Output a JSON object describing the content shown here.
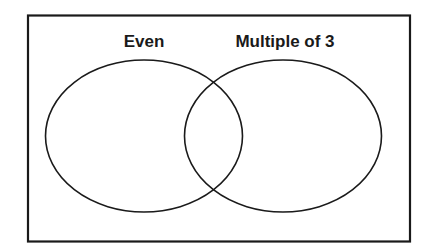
{
  "diagram": {
    "type": "venn",
    "sets": [
      {
        "label": "Even"
      },
      {
        "label": "Multiple of 3"
      }
    ],
    "colors": {
      "stroke": "#1a1a1a",
      "background": "#ffffff"
    }
  }
}
